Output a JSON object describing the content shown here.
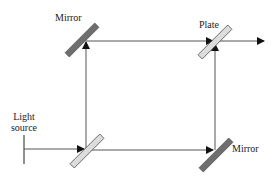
{
  "diagram": {
    "type": "Mach-Zehnder interferometer schematic",
    "labels": {
      "mirror_top": "Mirror",
      "plate": "Plate",
      "light_source_line1": "Light",
      "light_source_line2": "source",
      "mirror_bottom": "Mirror"
    },
    "components": [
      {
        "id": "light-source",
        "kind": "source",
        "label": "Light source"
      },
      {
        "id": "beam-splitter-input",
        "kind": "plate",
        "label": ""
      },
      {
        "id": "mirror-top-left",
        "kind": "mirror",
        "label": "Mirror"
      },
      {
        "id": "mirror-bottom-right",
        "kind": "mirror",
        "label": "Mirror"
      },
      {
        "id": "plate-output",
        "kind": "plate",
        "label": "Plate"
      }
    ],
    "colors": {
      "mirror_fill": "#6e6e6e",
      "plate_fill": "#dcdcdc",
      "outline": "#555555",
      "beam": "#555555",
      "arrow": "#111111",
      "text": "#222222"
    }
  }
}
